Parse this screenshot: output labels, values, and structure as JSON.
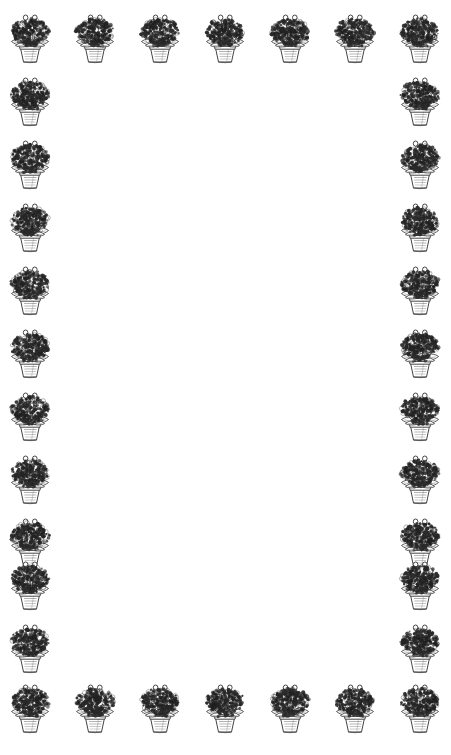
{
  "document": {
    "kind": "decorative-border-stationery",
    "title": "Potted Violet Border",
    "page_width": 451,
    "page_height": 755,
    "background_color": "#ffffff",
    "ink_color": "#1a1a1a",
    "body_text": ""
  },
  "motif": {
    "name": "potted-flowering-plant",
    "description": "African violet in a tapered clay pot",
    "width": 52,
    "height": 56,
    "flower_color": "#2b2b2b",
    "leaf_color": "#3a3a3a",
    "pot_color": "#444444"
  },
  "border": {
    "top_row": {
      "count": 7,
      "y": 8,
      "x_positions": [
        4,
        69,
        134,
        199,
        264,
        329,
        394
      ]
    },
    "bottom_row": {
      "count": 7,
      "y": 678,
      "x_positions": [
        4,
        69,
        134,
        199,
        264,
        329,
        394
      ]
    },
    "left_column": {
      "count": 12,
      "x": 4,
      "y_positions": [
        8,
        71,
        134,
        197,
        260,
        323,
        386,
        449,
        512,
        555,
        618,
        678
      ]
    },
    "right_column": {
      "count": 12,
      "x": 394,
      "y_positions": [
        8,
        71,
        134,
        197,
        260,
        323,
        386,
        449,
        512,
        555,
        618,
        678
      ]
    }
  }
}
